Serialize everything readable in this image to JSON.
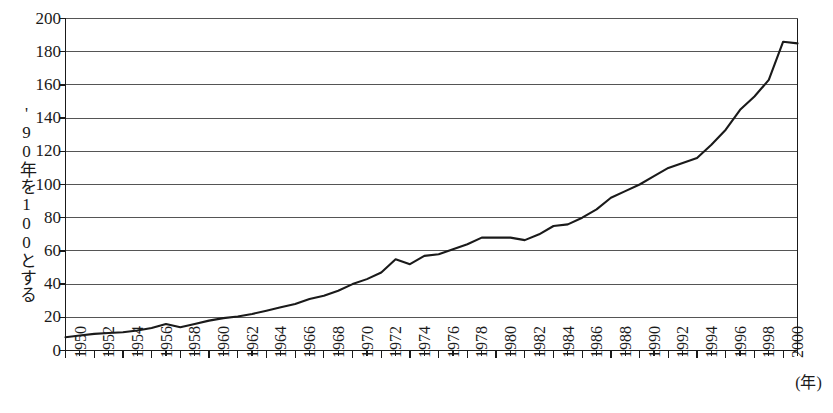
{
  "chart_data": {
    "type": "line",
    "title": "",
    "subtitle": "",
    "xlabel": "(年)",
    "ylabel": "'90年を100とする",
    "xlim": [
      1950,
      2001
    ],
    "ylim": [
      0,
      200
    ],
    "grid": true,
    "legend": false,
    "legend_position": "none",
    "line_color": "#1a1a1a",
    "y_ticks": [
      0,
      20,
      40,
      60,
      80,
      100,
      120,
      140,
      160,
      180,
      200
    ],
    "x_ticks": [
      1950,
      1952,
      1954,
      1956,
      1958,
      1960,
      1962,
      1964,
      1966,
      1968,
      1970,
      1972,
      1974,
      1976,
      1978,
      1980,
      1982,
      1984,
      1986,
      1988,
      1990,
      1992,
      1994,
      1996,
      1998,
      2000
    ],
    "x_tick_labels": [
      "1950",
      "1952",
      "1954",
      "1956",
      "1958",
      "1960",
      "1962",
      "1964",
      "1966",
      "1968",
      "1970",
      "1972",
      "1974",
      "1976",
      "1978",
      "1980",
      "1982",
      "1984",
      "1986",
      "1988",
      "1990",
      "1992",
      "1994",
      "1996",
      "1998",
      "2000"
    ],
    "y_tick_labels": [
      "0",
      "20",
      "40",
      "60",
      "80",
      "100",
      "120",
      "140",
      "160",
      "180",
      "200"
    ],
    "x": [
      1950,
      1951,
      1952,
      1953,
      1954,
      1955,
      1956,
      1957,
      1958,
      1959,
      1960,
      1961,
      1962,
      1963,
      1964,
      1965,
      1966,
      1967,
      1968,
      1969,
      1970,
      1971,
      1972,
      1973,
      1974,
      1975,
      1976,
      1977,
      1978,
      1979,
      1980,
      1981,
      1982,
      1983,
      1984,
      1985,
      1986,
      1987,
      1988,
      1989,
      1990,
      1991,
      1992,
      1993,
      1994,
      1995,
      1996,
      1997,
      1998,
      1999,
      2000,
      2001
    ],
    "values": [
      8,
      9,
      10,
      10.5,
      11,
      12,
      13.5,
      16,
      14,
      16,
      18,
      19.5,
      20.5,
      22,
      24,
      26,
      28,
      31,
      33,
      36,
      40,
      43,
      47,
      55,
      52,
      57,
      58,
      61,
      64,
      68,
      68,
      68,
      66.5,
      70,
      75,
      76,
      80,
      85,
      92,
      96,
      100,
      105,
      110,
      113,
      116,
      124,
      133,
      145,
      153,
      163,
      186,
      185
    ],
    "series": [
      {
        "name": "index",
        "values": [
          8,
          9,
          10,
          10.5,
          11,
          12,
          13.5,
          16,
          14,
          16,
          18,
          19.5,
          20.5,
          22,
          24,
          26,
          28,
          31,
          33,
          36,
          40,
          43,
          47,
          55,
          52,
          57,
          58,
          61,
          64,
          68,
          68,
          68,
          66.5,
          70,
          75,
          76,
          80,
          85,
          92,
          96,
          100,
          105,
          110,
          113,
          116,
          124,
          133,
          145,
          153,
          163,
          186,
          185
        ]
      }
    ],
    "annotations": []
  },
  "axes": {
    "y_title": "'90年を100とする",
    "x_unit": "(年)"
  }
}
